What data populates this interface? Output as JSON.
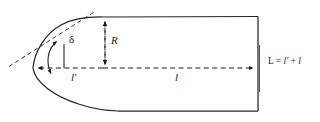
{
  "diagram": {
    "type": "geometric-profile",
    "labels": {
      "radius": "R",
      "nose_offset": "l'",
      "body_length": "l",
      "tangent_angle": "δ",
      "total_length_prefix": "L = ",
      "total_length_term1": "l'",
      "total_length_plus": " + ",
      "total_length_term2": "l",
      "total_length_full": "L = l' + l"
    },
    "colors": {
      "outline": "#1a1a1a",
      "dimension": "#1a1a1a",
      "background": "#ffffff"
    },
    "geometry": {
      "nose_tip_x": 33,
      "nose_tip_y": 68,
      "axis_y": 68,
      "shoulder_x": 103,
      "top_edge_y": 17,
      "bottom_edge_y": 111,
      "base_x": 258,
      "radius_px": 51,
      "nose_offset_px": 70,
      "body_length_px": 155
    }
  }
}
